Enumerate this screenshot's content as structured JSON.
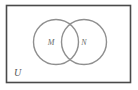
{
  "figure": {
    "type": "venn-diagram",
    "width": 138,
    "height": 90,
    "background_color": "#ffffff"
  },
  "universe": {
    "label": "U",
    "label_x": 14,
    "label_y": 74,
    "label_font_size": 10,
    "rect_x": 6.5,
    "rect_y": 5.5,
    "rect_width": 124,
    "rect_height": 77,
    "stroke_color": "#4a4a4a",
    "stroke_width": 1.6,
    "fill_color": "#ffffff"
  },
  "sets": [
    {
      "label": "M",
      "cx": 56,
      "cy": 42,
      "r": 22.5,
      "label_x": 51,
      "label_y": 43,
      "label_font_size": 8,
      "stroke_color": "#8f8f8f",
      "stroke_width": 1.4
    },
    {
      "label": "N",
      "cx": 84,
      "cy": 42,
      "r": 22.5,
      "label_x": 84,
      "label_y": 43,
      "label_font_size": 8,
      "stroke_color": "#8f8f8f",
      "stroke_width": 1.4
    }
  ],
  "colors": {
    "rect_stroke": "#4a4a4a",
    "circle_stroke": "#8f8f8f",
    "label_text": "#6b6b6b",
    "universe_label_text": "#555555",
    "background": "#ffffff"
  }
}
